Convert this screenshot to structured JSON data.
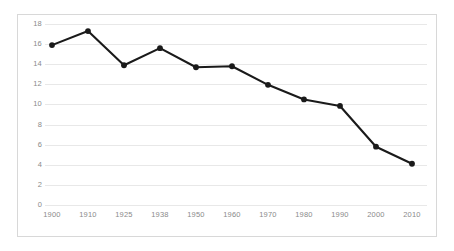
{
  "chart_data": {
    "type": "line",
    "title": "",
    "subtitle": "",
    "xlabel": "",
    "ylabel": "",
    "categories": [
      "1900",
      "1910",
      "1925",
      "1938",
      "1950",
      "1960",
      "1970",
      "1980",
      "1990",
      "2000",
      "2010"
    ],
    "values": [
      15.9,
      17.3,
      13.9,
      15.6,
      13.7,
      13.8,
      11.95,
      10.5,
      9.85,
      5.8,
      4.1
    ],
    "series": [
      {
        "name": "",
        "values": [
          15.9,
          17.3,
          13.9,
          15.6,
          13.7,
          13.8,
          11.95,
          10.5,
          9.85,
          5.8,
          4.1
        ]
      }
    ],
    "ylim": [
      0,
      18
    ],
    "yticks": [
      0,
      2,
      4,
      6,
      8,
      10,
      12,
      14,
      16,
      18
    ],
    "ytick_labels": [
      "0",
      "2",
      "4",
      "6",
      "8",
      "10",
      "12",
      "14",
      "16",
      "18"
    ],
    "xtick_labels": [
      "1900",
      "1910",
      "1925",
      "1938",
      "1950",
      "1960",
      "1970",
      "1980",
      "1990",
      "2000",
      "2010"
    ],
    "grid": true,
    "grid_axis": "y",
    "legend": false,
    "legend_position": "none",
    "annotations": [],
    "markers": true,
    "colors": {
      "line": "#1a1a1a",
      "marker": "#1a1a1a",
      "grid": "#e8e8e8",
      "tick_text": "#8a8a8a",
      "frame_border": "#d8d8d8",
      "background": "#ffffff"
    }
  }
}
